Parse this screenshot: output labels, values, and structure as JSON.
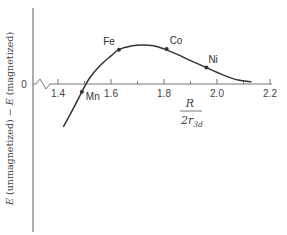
{
  "chart_data": {
    "type": "line",
    "title": "",
    "xlabel": "R / 2r_3d",
    "xlabel_parts": {
      "numerator": "R",
      "denominator": "2r",
      "subscript": "3d"
    },
    "ylabel": "E (unmagnetized) − E (magnetized)",
    "ylabel_parts": {
      "e1": "E",
      "t1": " (unmagnetized) − ",
      "e2": "E",
      "t2": " (magnetized)"
    },
    "y_zero_label": "0",
    "xlim": [
      1.3,
      2.2
    ],
    "x_ticks": [
      {
        "value": 1.4,
        "label": "1.4",
        "labeled": true
      },
      {
        "value": 1.5,
        "label": "",
        "labeled": false
      },
      {
        "value": 1.6,
        "label": "1.6",
        "labeled": true
      },
      {
        "value": 1.7,
        "label": "",
        "labeled": false
      },
      {
        "value": 1.8,
        "label": "1.8",
        "labeled": true
      },
      {
        "value": 1.9,
        "label": "",
        "labeled": false
      },
      {
        "value": 2.0,
        "label": "2.0",
        "labeled": true
      },
      {
        "value": 2.1,
        "label": "",
        "labeled": false
      },
      {
        "value": 2.2,
        "label": "2.2",
        "labeled": true
      }
    ],
    "axis_break": true,
    "grid": false,
    "legend": null,
    "series": [
      {
        "name": "Bethe-Slater curve",
        "x": [
          1.42,
          1.46,
          1.49,
          1.52,
          1.56,
          1.6,
          1.63,
          1.68,
          1.72,
          1.76,
          1.8,
          1.85,
          1.9,
          1.96,
          2.02,
          2.08,
          2.13
        ],
        "y": [
          -0.55,
          -0.3,
          -0.1,
          0.08,
          0.24,
          0.36,
          0.44,
          0.49,
          0.5,
          0.49,
          0.45,
          0.38,
          0.3,
          0.21,
          0.12,
          0.05,
          0.03
        ]
      }
    ],
    "annotations": [
      {
        "label": "Mn",
        "x": 1.49,
        "y": -0.1
      },
      {
        "label": "Fe",
        "x": 1.63,
        "y": 0.44
      },
      {
        "label": "Co",
        "x": 1.81,
        "y": 0.45
      },
      {
        "label": "Ni",
        "x": 1.96,
        "y": 0.21
      }
    ]
  }
}
